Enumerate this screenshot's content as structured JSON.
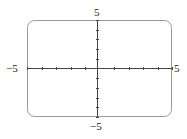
{
  "chart_data": {
    "type": "line",
    "title": "",
    "xlabel": "",
    "ylabel": "",
    "xlim": [
      -5,
      5
    ],
    "ylim": [
      -5,
      5
    ],
    "x_ticks": [
      -5,
      -4,
      -3,
      -2,
      -1,
      0,
      1,
      2,
      3,
      4,
      5
    ],
    "y_ticks": [
      -5,
      -4,
      -3,
      -2,
      -1,
      0,
      1,
      2,
      3,
      4,
      5
    ],
    "tick_labels": {
      "x_min": "−5",
      "x_max": "5",
      "y_min": "−5",
      "y_max": "5"
    },
    "series": [],
    "grid": false,
    "legend": null,
    "frame": "rounded-rectangle viewing window"
  },
  "colors": {
    "axis": "#444444",
    "frame": "#9a9a9a",
    "text": "#222222",
    "background": "#ffffff"
  }
}
